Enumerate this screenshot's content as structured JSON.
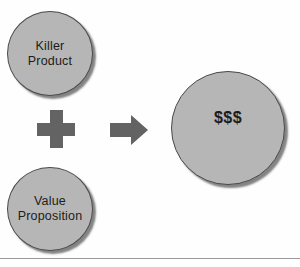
{
  "diagram": {
    "background_color": "#fefefe",
    "node_fill_color": "#b6b6b6",
    "node_border_color": "#4a4a4a",
    "operator_color": "#636363",
    "text_color": "#1c1c1c",
    "rule_color": "#9a9a9a",
    "nodes": [
      {
        "id": "killer-product",
        "label": "Killer\nProduct",
        "shape": "circle"
      },
      {
        "id": "value-proposition",
        "label": "Value\nProposition",
        "shape": "circle"
      },
      {
        "id": "money",
        "label": "$$$",
        "shape": "circle"
      }
    ],
    "operators": [
      {
        "id": "plus",
        "symbol": "+",
        "name": "plus-operator"
      },
      {
        "id": "arrow",
        "symbol": "→",
        "name": "right-arrow-operator"
      }
    ]
  }
}
